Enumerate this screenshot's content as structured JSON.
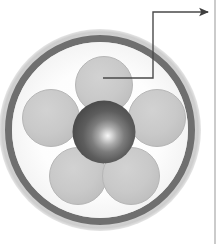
{
  "figure": {
    "name": "cable-cross-section",
    "width": 221,
    "height": 244,
    "background_color": "#ffffff"
  },
  "colors": {
    "background": "#ffffff",
    "outer_jacket": "#d5d5d5",
    "outer_jacket_edge": "#c2c2c2",
    "sheath_ring": "#6f6f6f",
    "inner_fill": "#fefefe",
    "conductor_fill": "#c8c8c8",
    "conductor_edge": "#b3b3b3",
    "core_dark": "#4b4b4b",
    "core_mid": "#6a6a6a",
    "core_highlight": "#f2f2f2",
    "leader_line": "#4a4a4a",
    "panel_border": "#a8a8a8"
  },
  "geometry": {
    "center_x": 100,
    "center_y": 130,
    "outer_radius": 101,
    "jacket_inner_radius": 95,
    "sheath_outer_radius": 95,
    "sheath_inner_radius": 88,
    "conductor_radius": 28,
    "core_radius": 31,
    "core_center_x": 104,
    "core_center_y": 132
  },
  "parts": {
    "outer_jacket": {
      "label": "outer jacket",
      "radius": 101
    },
    "sheath": {
      "label": "sheath ring",
      "radius": 92
    },
    "core": {
      "label": "central core",
      "radius": 31
    },
    "conductors": [
      {
        "label": "conductor-top",
        "cx": 104,
        "cy": 85,
        "r": 28
      },
      {
        "label": "conductor-upper-left",
        "cx": 51,
        "cy": 118,
        "r": 28
      },
      {
        "label": "conductor-upper-right",
        "cx": 157,
        "cy": 118,
        "r": 28
      },
      {
        "label": "conductor-lower-left",
        "cx": 78,
        "cy": 176,
        "r": 28
      },
      {
        "label": "conductor-lower-right",
        "cx": 131,
        "cy": 176,
        "r": 28
      }
    ]
  },
  "callout": {
    "name": "conductor-callout",
    "target_x": 103,
    "target_y": 78,
    "elbow_x": 153,
    "elbow_y": 78,
    "top_y": 12,
    "arrow_x": 210,
    "arrow_label": "",
    "stroke_width": 1.4
  },
  "panel_edge": {
    "name": "adjacent-panel-left-border",
    "x": 215
  }
}
